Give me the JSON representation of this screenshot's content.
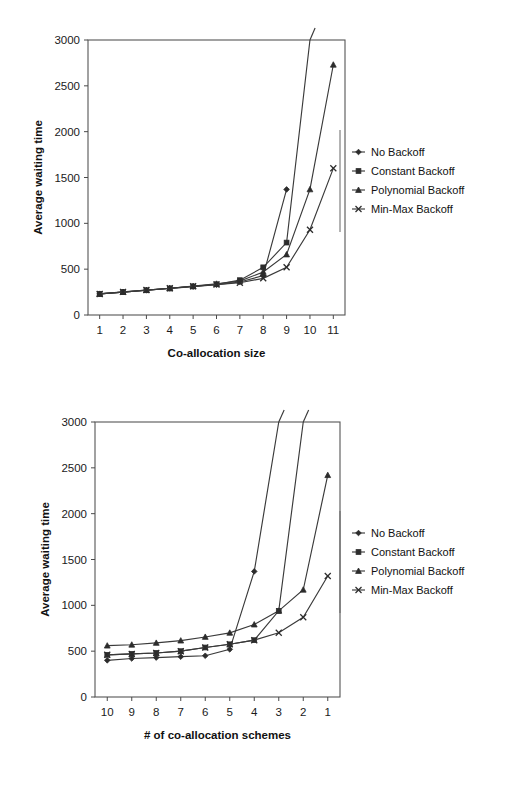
{
  "figures": [
    {
      "id": "figure-1",
      "chart_data": {
        "type": "line",
        "title": "",
        "xlabel": "Co-allocation size",
        "ylabel": "Average waiting time",
        "categories": [
          "1",
          "2",
          "3",
          "4",
          "5",
          "6",
          "7",
          "8",
          "9",
          "10",
          "11"
        ],
        "ylim": [
          0,
          3000
        ],
        "yticks": [
          0,
          500,
          1000,
          1500,
          2000,
          2500,
          3000
        ],
        "grid": false,
        "legend_position": "right",
        "series": [
          {
            "name": "No Backoff",
            "marker": "diamond",
            "values": [
              230,
              250,
              270,
              290,
              310,
              330,
              360,
              430,
              1370,
              null,
              null
            ]
          },
          {
            "name": "Constant Backoff",
            "marker": "square",
            "values": [
              230,
              250,
              270,
              290,
              312,
              335,
              380,
              520,
              790,
              3000,
              null
            ]
          },
          {
            "name": "Polynomial Backoff",
            "marker": "triangle",
            "values": [
              230,
              250,
              272,
              292,
              315,
              340,
              370,
              470,
              660,
              1370,
              2730
            ]
          },
          {
            "name": "Min-Max Backoff",
            "marker": "cross",
            "values": [
              230,
              252,
              272,
              292,
              314,
              332,
              352,
              400,
              520,
              930,
              1600
            ]
          }
        ]
      }
    },
    {
      "id": "figure-2",
      "chart_data": {
        "type": "line",
        "title": "",
        "xlabel": "# of co-allocation schemes",
        "ylabel": "Average waiting time",
        "categories": [
          "10",
          "9",
          "8",
          "7",
          "6",
          "5",
          "4",
          "3",
          "2",
          "1"
        ],
        "ylim": [
          0,
          3000
        ],
        "yticks": [
          0,
          500,
          1000,
          1500,
          2000,
          2500,
          3000
        ],
        "grid": false,
        "legend_position": "right",
        "series": [
          {
            "name": "No Backoff",
            "marker": "diamond",
            "values": [
              400,
              420,
              430,
              440,
              450,
              520,
              1370,
              3000,
              null,
              null
            ]
          },
          {
            "name": "Constant Backoff",
            "marker": "square",
            "values": [
              460,
              470,
              480,
              500,
              540,
              575,
              620,
              940,
              3000,
              null
            ]
          },
          {
            "name": "Polynomial Backoff",
            "marker": "triangle",
            "values": [
              560,
              570,
              590,
              615,
              655,
              700,
              790,
              940,
              1170,
              2420
            ]
          },
          {
            "name": "Min-Max Backoff",
            "marker": "cross",
            "values": [
              460,
              470,
              480,
              500,
              540,
              575,
              620,
              700,
              870,
              1320
            ]
          }
        ]
      }
    }
  ]
}
